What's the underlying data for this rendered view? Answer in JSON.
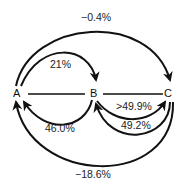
{
  "nodes": [
    {
      "id": "A",
      "label": "A"
    },
    {
      "id": "B",
      "label": "B"
    },
    {
      "id": "C",
      "label": "C"
    }
  ],
  "edges": [
    {
      "from": "A",
      "to": "C",
      "label": "−0.4%",
      "position": "top-outer"
    },
    {
      "from": "A",
      "to": "B",
      "label": "21%",
      "position": "top-inner"
    },
    {
      "from": "B",
      "to": "A",
      "label": "46.0%",
      "position": "bottom-inner"
    },
    {
      "from": "B",
      "to": "C",
      "label": ">49.9%",
      "position": "bottom-upper"
    },
    {
      "from": "C",
      "to": "B",
      "label": "49.2%",
      "position": "bottom-lower"
    },
    {
      "from": "C",
      "to": "A",
      "label": "−18.6%",
      "position": "bottom-outer"
    }
  ],
  "lines": [
    {
      "from": "A",
      "to": "B",
      "type": "undirected"
    },
    {
      "from": "B",
      "to": "C",
      "type": "undirected"
    }
  ],
  "colors": {
    "stroke": "#111111",
    "text": "#222222",
    "background": "#ffffff"
  }
}
